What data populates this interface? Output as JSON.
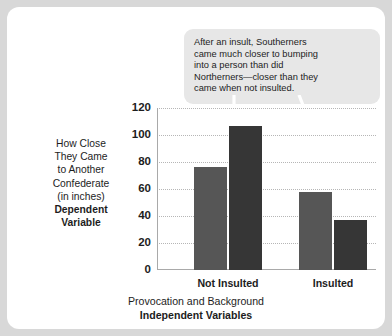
{
  "callout": {
    "lines": [
      "After an insult, Southerners",
      "came much closer to bumping",
      "into a person than did",
      "Northerners—closer than they",
      "came when not insulted."
    ],
    "background": "#e7e7e7"
  },
  "annotations": [
    {
      "name": "arrow-to-southerners-not-insulted",
      "target": "Not Insulted / Southerner",
      "color": "#ffffff"
    },
    {
      "name": "arrow-to-southerners-insulted",
      "target": "Insulted / Southerner",
      "color": "#ffffff"
    }
  ],
  "y_axis_title": {
    "lines": [
      {
        "text": "How Close",
        "bold": false
      },
      {
        "text": "They Came",
        "bold": false
      },
      {
        "text": "to Another",
        "bold": false
      },
      {
        "text": "Confederate",
        "bold": false
      },
      {
        "text": "(in inches)",
        "bold": false
      },
      {
        "text": "Dependent",
        "bold": true
      },
      {
        "text": "Variable",
        "bold": true
      }
    ]
  },
  "x_axis_title": {
    "lines": [
      {
        "text": "Provocation and Background",
        "bold": false
      },
      {
        "text": "Independent Variables",
        "bold": true
      }
    ]
  },
  "chart_data": {
    "type": "bar",
    "title": "",
    "xlabel": "Provocation and Background / Independent Variables",
    "ylabel": "How Close They Came to Another Confederate (in inches) / Dependent Variable",
    "categories": [
      "Not Insulted",
      "Insulted"
    ],
    "series": [
      {
        "name": "Northerners",
        "values": [
          76,
          58
        ],
        "color": "#565656"
      },
      {
        "name": "Southerners",
        "values": [
          107,
          37
        ],
        "color": "#363636"
      }
    ],
    "ylim": [
      0,
      120
    ],
    "yticks": [
      0,
      20,
      40,
      60,
      80,
      100,
      120
    ],
    "ytick_labels": [
      "0",
      "20",
      "40",
      "60",
      "80",
      "100",
      "120"
    ],
    "grid": true,
    "grid_style": "dotted",
    "grid_color": "#b6b6b6",
    "legend": "none",
    "axis_color": "#a9a9a9",
    "background": "#ffffff"
  }
}
